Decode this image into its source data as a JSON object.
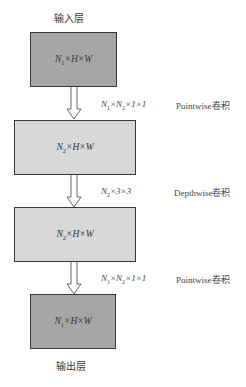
{
  "diagram": {
    "input_label": "输入层",
    "output_label": "输出层",
    "boxes": [
      {
        "n": "1",
        "rest": "×H×W",
        "shade": "dark"
      },
      {
        "n": "2",
        "rest": "×H×W",
        "shade": "light"
      },
      {
        "n": "2",
        "rest": "×H×W",
        "shade": "light"
      },
      {
        "n": "1",
        "rest": "×H×W",
        "shade": "dark"
      }
    ],
    "operations": [
      {
        "shape_a": "1",
        "shape_b": "2",
        "shape_tail": "×1×1",
        "name": "Pointwise卷积"
      },
      {
        "shape_a": "2",
        "shape_tail": "×3×3",
        "name": "Depthwise卷积"
      },
      {
        "shape_a": "1",
        "shape_b": "2",
        "shape_tail": "×1×1",
        "name": "Pointwise卷积"
      }
    ],
    "symbols": {
      "N": "N",
      "times": "×"
    },
    "colors": {
      "dark_box": "#a6a6a6",
      "light_box": "#d8d8d8",
      "border": "#3a3a3a"
    }
  }
}
